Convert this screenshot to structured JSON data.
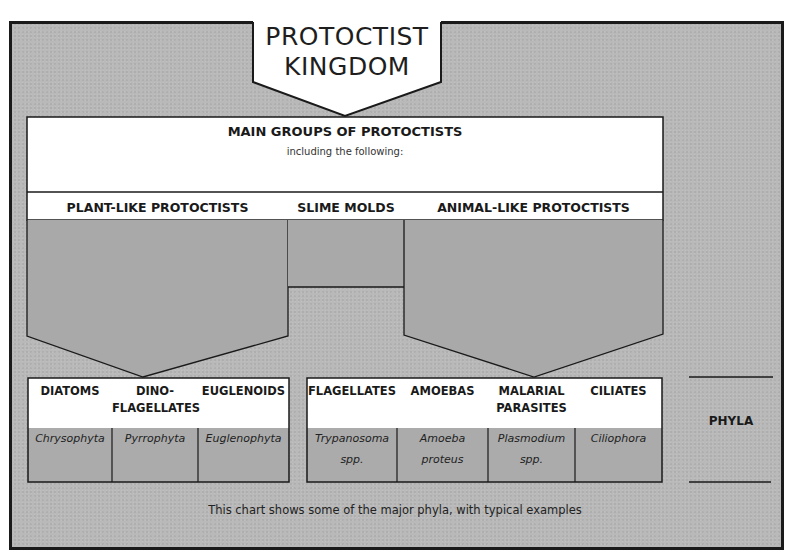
{
  "title": {
    "line1": "PROTOCTIST",
    "line2": "KINGDOM"
  },
  "main_groups": {
    "title": "MAIN GROUPS OF PROTOCTISTS",
    "subtitle": "including the following:"
  },
  "groups": [
    {
      "label": "PLANT-LIKE PROTOCTISTS"
    },
    {
      "label": "SLIME MOLDS"
    },
    {
      "label": "ANIMAL-LIKE PROTOCTISTS"
    }
  ],
  "plant_like": [
    {
      "name": "DIATOMS",
      "phylum": "Chrysophyta"
    },
    {
      "name_line1": "DINO-",
      "name_line2": "FLAGELLATES",
      "phylum": "Pyrrophyta"
    },
    {
      "name": "EUGLENOIDS",
      "phylum": "Euglenophyta"
    }
  ],
  "animal_like": [
    {
      "name": "FLAGELLATES",
      "example_line1": "Trypanosoma",
      "example_line2": "spp."
    },
    {
      "name": "AMOEBAS",
      "example_line1": "Amoeba",
      "example_line2": "proteus"
    },
    {
      "name_line1": "MALARIAL",
      "name_line2": "PARASITES",
      "example_line1": "Plasmodium",
      "example_line2": "spp."
    },
    {
      "name": "CILIATES",
      "phylum": "Ciliophora"
    }
  ],
  "phyla_label": "PHYLA",
  "caption": "This chart shows some of the major phyla, with typical examples",
  "colors": {
    "background_gray": "#b9b9b9",
    "fill_gray": "#a9a9a9",
    "white": "#ffffff",
    "line": "#1a1a1a"
  }
}
